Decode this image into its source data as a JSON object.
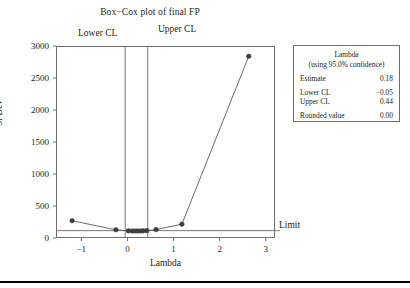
{
  "chart_data": {
    "type": "line",
    "title": "Box−Cox plot of final FP",
    "xlabel": "Lambda",
    "ylabel": "St Dev",
    "xlim": [
      -1.55,
      3.2
    ],
    "ylim": [
      0,
      3000
    ],
    "xticks": [
      -1,
      0,
      1,
      2,
      3
    ],
    "xticklabels": [
      "−1",
      "0",
      "1",
      "2",
      "3"
    ],
    "yticks": [
      0,
      500,
      1000,
      1500,
      2000,
      2500,
      3000
    ],
    "yticklabels": [
      "0",
      "500",
      "1000",
      "1500",
      "2000",
      "2500",
      "3000"
    ],
    "grid": false,
    "legend_position": "right-outside",
    "series": [
      {
        "name": "St Dev vs Lambda",
        "marker": "filled-circle",
        "x": [
          -1.2,
          -0.25,
          0.02,
          0.1,
          0.16,
          0.22,
          0.28,
          0.34,
          0.42,
          0.62,
          1.18,
          2.63
        ],
        "y": [
          270,
          128,
          112,
          110,
          110,
          110,
          110,
          112,
          115,
          132,
          216,
          2840
        ]
      }
    ],
    "reference_lines": [
      {
        "name": "lower-cl",
        "orientation": "vertical",
        "value": -0.05,
        "label": "Lower CL"
      },
      {
        "name": "upper-cl",
        "orientation": "vertical",
        "value": 0.44,
        "label": "Upper CL"
      },
      {
        "name": "limit",
        "orientation": "horizontal",
        "value": 115,
        "label": "Limit"
      }
    ],
    "annotations": [
      "Lower CL",
      "Upper CL",
      "Limit"
    ]
  },
  "legend": {
    "title": "Lambda",
    "subtitle": "(using 95.0% confidence)",
    "rows": [
      {
        "label": "Estimate",
        "value": "0.18"
      },
      {
        "label": "Lower CL",
        "value": "−0.05"
      },
      {
        "label": "Upper CL",
        "value": "0.44"
      },
      {
        "label": "Rounded value",
        "value": "0.00"
      }
    ]
  },
  "colors": {
    "axis": "#6f6f6f",
    "series": "#58595b",
    "marker": "#3f3f41",
    "reference": "#7a7a7a",
    "text": "#231f20"
  }
}
